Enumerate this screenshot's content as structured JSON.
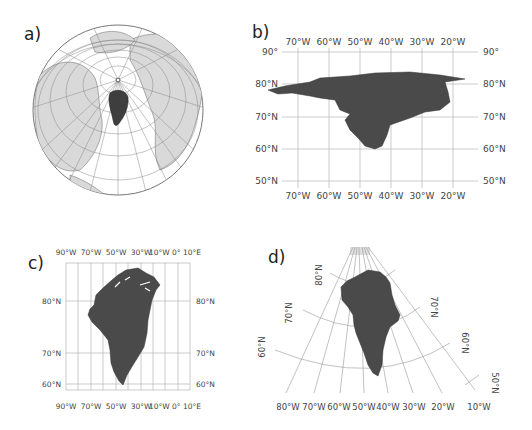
{
  "panels": {
    "a": {
      "label": "a)",
      "projection": "orthographic globe centered on Greenland / North Pole"
    },
    "b": {
      "label": "b)",
      "top_lon_labels": [
        "70°W",
        "60°W",
        "50°W",
        "40°W",
        "30°W",
        "20°W"
      ],
      "bottom_lon_labels": [
        "70°W",
        "60°W",
        "50°W",
        "40°W",
        "30°W",
        "20°W"
      ],
      "left_lat_labels": [
        "90°",
        "80°N",
        "70°N",
        "60°N",
        "50°N"
      ],
      "right_lat_labels": [
        "90°",
        "80°N",
        "70°N",
        "60°N",
        "50°N"
      ]
    },
    "c": {
      "label": "c)",
      "top_lon_labels": [
        "90°W",
        "70°W",
        "50°W",
        "30°W",
        "10°W 0° 10°E"
      ],
      "bottom_lon_labels": [
        "90°W",
        "70°W",
        "50°W",
        "30°W",
        "10°W 0° 10°E"
      ],
      "left_lat_labels": [
        "80°N",
        "70°N",
        "60°N"
      ],
      "right_lat_labels": [
        "80°N",
        "70°N",
        "60°N"
      ]
    },
    "d": {
      "label": "d)",
      "bottom_lon_labels": [
        "80°W",
        "70°W",
        "60°W",
        "50°W",
        "40°W",
        "30°W",
        "20°W",
        "10°W"
      ],
      "left_lat_labels": [
        "80°N",
        "70°N",
        "60°N"
      ],
      "right_lat_labels": [
        "70°N",
        "60°N",
        "50°N"
      ]
    }
  },
  "colors": {
    "greenland": "#4a4a4a",
    "land": "#d9d9d9",
    "grid": "#9a9a9a",
    "ocean": "#ffffff"
  }
}
